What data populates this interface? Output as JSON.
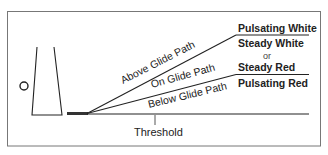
{
  "diagram": {
    "paths": [
      {
        "label": "Above Glide Path",
        "indication_top": "Pulsating White",
        "indication_bottom": "Steady White"
      },
      {
        "label": "On Glide Path",
        "indication_top": "Steady Red",
        "indication_bottom": "Pulsating Red"
      },
      {
        "label": "Below Glide Path"
      }
    ],
    "labels": {
      "above": "Above Glide Path",
      "on": "On Glide Path",
      "below": "Below Glide Path",
      "pulsating_white": "Pulsating White",
      "steady_white": "Steady White",
      "or": "or",
      "steady_red": "Steady Red",
      "pulsating_red": "Pulsating Red",
      "threshold": "Threshold"
    },
    "colors": {
      "line": "#222222",
      "border": "#777777",
      "background": "#ffffff"
    }
  }
}
